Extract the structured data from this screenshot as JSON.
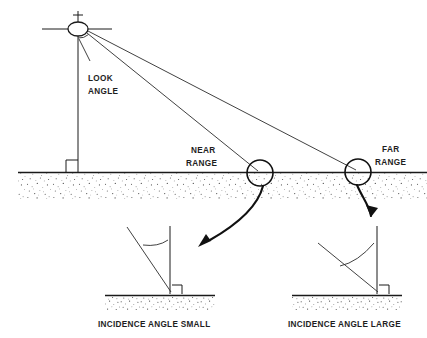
{
  "figure": {
    "type": "radar-geometry-diagram",
    "background_color": "#ffffff",
    "line_color": "#1a1a1a",
    "ground_fill_color": "#555555"
  },
  "labels": {
    "look_angle_line1": "LOOK",
    "look_angle_line2": "ANGLE",
    "near_range_line1": "NEAR",
    "near_range_line2": "RANGE",
    "far_range_line1": "FAR",
    "far_range_line2": "RANGE",
    "inset_left_caption": "INCIDENCE ANGLE SMALL",
    "inset_right_caption": "INCIDENCE ANGLE LARGE"
  },
  "geometry": {
    "platform": {
      "center_x": 78,
      "center_y": 29,
      "rx": 10,
      "ry": 7,
      "antenna_left_x": 42,
      "antenna_right_x": 112,
      "mast_top_y": 12,
      "mast_bottom_y": 172
    },
    "ground_line": {
      "x1": 18,
      "x2": 427,
      "y": 172
    },
    "ground_band": {
      "top_y": 173,
      "bottom_y": 198
    },
    "beams": [
      {
        "name": "near-range-beam",
        "x1": 86,
        "y1": 33,
        "x2": 260,
        "y2": 172
      },
      {
        "name": "far-range-beam",
        "x1": 86,
        "y1": 32,
        "x2": 358,
        "y2": 172
      }
    ],
    "range_markers": [
      {
        "name": "near-range-circle",
        "cx": 260,
        "cy": 173,
        "r": 13
      },
      {
        "name": "far-range-circle",
        "cx": 358,
        "cy": 172,
        "r": 13
      }
    ],
    "insets": [
      {
        "name": "incidence-angle-small",
        "ground_x1": 105,
        "ground_x2": 215,
        "ground_y": 295,
        "normal_x": 170,
        "normal_top_y": 226,
        "ray_x1": 127,
        "ray_y1": 227,
        "ray_x2": 170,
        "ray_y2": 292
      },
      {
        "name": "incidence-angle-large",
        "ground_x1": 292,
        "ground_x2": 402,
        "ground_y": 295,
        "normal_x": 377,
        "normal_top_y": 226,
        "ray_x1": 318,
        "ray_y1": 243,
        "ray_x2": 377,
        "ray_y2": 292
      }
    ]
  },
  "icons": {
    "platform": "satellite-platform-icon",
    "near_arrow": "curved-arrow-icon",
    "far_arrow": "curved-arrow-icon",
    "right_angle": "right-angle-marker-icon",
    "angle_arc": "angle-arc-icon"
  }
}
